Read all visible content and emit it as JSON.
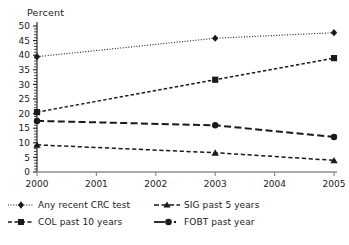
{
  "chart_data": {
    "type": "line",
    "title": "",
    "xlabel": "",
    "ylabel": "Percent",
    "x": [
      2000,
      2003,
      2005
    ],
    "categories": [
      "2000",
      "2001",
      "2002",
      "2003",
      "2004",
      "2005"
    ],
    "xlim": [
      2000,
      2005
    ],
    "ylim": [
      0,
      50
    ],
    "yticks": [
      0,
      5,
      10,
      15,
      20,
      25,
      30,
      35,
      40,
      45,
      50
    ],
    "ytick_labels": [
      "0",
      "5",
      "10",
      "15",
      "20",
      "25",
      "30",
      "35",
      "40",
      "45",
      "50"
    ],
    "xticks": [
      2000,
      2001,
      2002,
      2003,
      2004,
      2005
    ],
    "xtick_labels": [
      "2000",
      "2001",
      "2002",
      "2003",
      "2004",
      "2005"
    ],
    "grid": false,
    "legend_position": "below",
    "series": [
      {
        "name": "Any recent CRC test",
        "x": [
          2000,
          2003,
          2005
        ],
        "values": [
          39.5,
          45.8,
          47.7
        ],
        "line_style": "dotted",
        "marker": "diamond",
        "color": "#1a1a1a"
      },
      {
        "name": "COL past 10 years",
        "x": [
          2000,
          2003,
          2005
        ],
        "values": [
          20.5,
          31.6,
          39.0
        ],
        "line_style": "short-dash",
        "marker": "square",
        "color": "#1a1a1a"
      },
      {
        "name": "FOBT past year",
        "x": [
          2000,
          2003,
          2005
        ],
        "values": [
          17.5,
          16.0,
          12.0
        ],
        "line_style": "long-dash",
        "marker": "circle",
        "color": "#1a1a1a"
      },
      {
        "name": "SIG past 5 years",
        "x": [
          2000,
          2003,
          2005
        ],
        "values": [
          9.3,
          6.6,
          4.0
        ],
        "line_style": "medium-dash",
        "marker": "triangle",
        "color": "#1a1a1a"
      }
    ]
  },
  "axis": {
    "y_title": "Percent"
  },
  "legend": {
    "rows": [
      [
        {
          "label": "Any recent CRC test",
          "series": "Any recent CRC test"
        },
        {
          "label": "SIG past 5 years",
          "series": "SIG past 5 years"
        }
      ],
      [
        {
          "label": "COL past 10 years",
          "series": "COL past 10 years"
        },
        {
          "label": "FOBT past year",
          "series": "FOBT past year"
        }
      ]
    ]
  },
  "colors": {
    "ink": "#1a1a1a",
    "axis": "#8e8e8e",
    "background": "#ffffff"
  }
}
